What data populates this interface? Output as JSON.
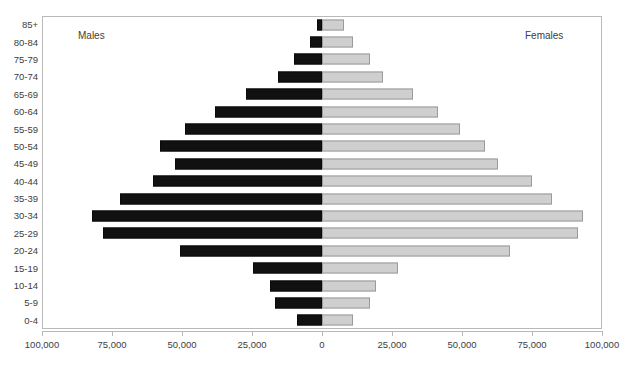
{
  "top_sliver_text": " ",
  "chart_data": {
    "type": "bar",
    "subtype": "population-pyramid",
    "title": "",
    "xlabel": "",
    "ylabel": "",
    "orientation": "horizontal",
    "grid": false,
    "legend_position": "in-plot",
    "axis": {
      "zero_label": "0",
      "xlim": [
        -100000,
        100000
      ],
      "tick_values": [
        -100000,
        -75000,
        -50000,
        -25000,
        0,
        25000,
        50000,
        75000,
        100000
      ],
      "tick_labels": [
        "100,000",
        "75,000",
        "50,000",
        "25,000",
        "0",
        "25,000",
        "50,000",
        "75,000",
        "100,000"
      ]
    },
    "categories": [
      "85+",
      "80-84",
      "75-79",
      "70-74",
      "65-69",
      "60-64",
      "55-59",
      "50-54",
      "45-49",
      "40-44",
      "35-39",
      "30-34",
      "25-29",
      "20-24",
      "15-19",
      "10-14",
      "5-9",
      "0-4"
    ],
    "series": [
      {
        "name": "Males",
        "side": "left",
        "color": "#111111",
        "values": [
          1800,
          4300,
          10000,
          15700,
          27100,
          38200,
          48900,
          57900,
          52500,
          60400,
          72100,
          82100,
          78200,
          50700,
          24600,
          18600,
          16800,
          8900
        ]
      },
      {
        "name": "Females",
        "side": "right",
        "color": "#cfcfcf",
        "values": [
          7900,
          11100,
          17100,
          21800,
          32500,
          41400,
          49300,
          58200,
          62900,
          75000,
          82100,
          93200,
          91400,
          67100,
          27100,
          19300,
          17100,
          11100
        ]
      }
    ],
    "annotations": [
      {
        "name": "males-label",
        "text": "Males"
      },
      {
        "name": "females-label",
        "text": "Females"
      }
    ]
  }
}
